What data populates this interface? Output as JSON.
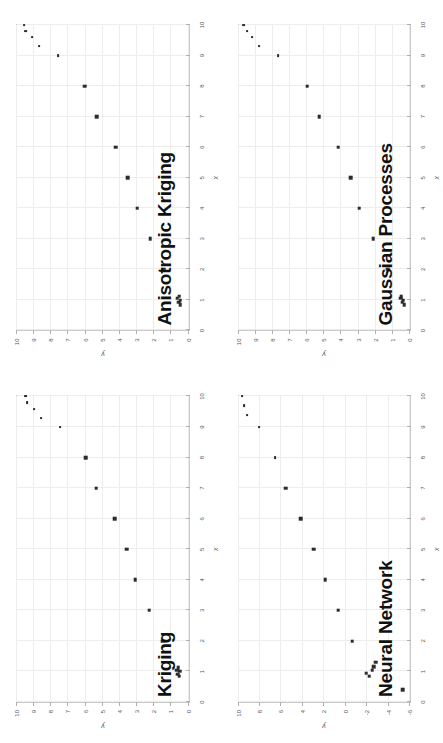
{
  "figure": {
    "layout": "2x2 grid of scatter panels",
    "rotation_degrees": -90,
    "background_color": "#ffffff",
    "marker_color": "#2b2b2b",
    "grid_color": "#ededed",
    "frame_color": "#c9c9c9"
  },
  "panels": [
    {
      "id": "kriging",
      "title": "Kriging",
      "position": "top-left"
    },
    {
      "id": "anisotropic-kriging",
      "title": "Anisotropic Kriging",
      "position": "top-right"
    },
    {
      "id": "neural-network",
      "title": "Neural Network",
      "position": "bottom-left"
    },
    {
      "id": "gaussian-processes",
      "title": "Gaussian Processes",
      "position": "bottom-right"
    }
  ],
  "chart_data": [
    {
      "type": "scatter",
      "title": "Kriging",
      "xlabel": "x",
      "ylabel": "y",
      "xlim": [
        0,
        10
      ],
      "ylim": [
        0,
        10
      ],
      "xticks": [
        0,
        1,
        2,
        3,
        4,
        5,
        6,
        7,
        8,
        9,
        10
      ],
      "yticks": [
        0,
        1,
        2,
        3,
        4,
        5,
        6,
        7,
        8,
        9,
        10
      ],
      "grid": true,
      "legend": "none",
      "x": [
        0.85,
        0.92,
        1.0,
        1.05,
        1.12,
        2.0,
        3.0,
        4.0,
        5.0,
        6.0,
        7.0,
        8.0,
        9.0,
        9.3,
        9.6,
        9.8,
        10.0
      ],
      "y": [
        0.55,
        0.62,
        0.52,
        0.7,
        0.6,
        1.5,
        2.3,
        3.1,
        3.6,
        4.3,
        5.4,
        6.0,
        7.5,
        8.6,
        9.0,
        9.4,
        9.5
      ]
    },
    {
      "type": "scatter",
      "title": "Anisotropic Kriging",
      "xlabel": "x",
      "ylabel": "y",
      "xlim": [
        0,
        10
      ],
      "ylim": [
        0,
        10
      ],
      "xticks": [
        0,
        1,
        2,
        3,
        4,
        5,
        6,
        7,
        8,
        9,
        10
      ],
      "yticks": [
        0,
        1,
        2,
        3,
        4,
        5,
        6,
        7,
        8,
        9,
        10
      ],
      "grid": true,
      "legend": "none",
      "x": [
        0.85,
        0.92,
        1.0,
        1.05,
        1.12,
        2.0,
        3.0,
        4.0,
        5.0,
        6.0,
        7.0,
        8.0,
        9.0,
        9.3,
        9.6,
        9.8,
        10.0
      ],
      "y": [
        0.5,
        0.58,
        0.48,
        0.66,
        0.56,
        1.45,
        2.25,
        3.0,
        3.55,
        4.25,
        5.35,
        6.05,
        7.6,
        8.7,
        9.1,
        9.5,
        9.6
      ]
    },
    {
      "type": "scatter",
      "title": "Neural Network",
      "xlabel": "x",
      "ylabel": "y",
      "xlim": [
        0,
        10
      ],
      "ylim": [
        -6,
        10
      ],
      "xticks": [
        0,
        1,
        2,
        3,
        4,
        5,
        6,
        7,
        8,
        9,
        10
      ],
      "yticks": [
        -6,
        -4,
        -2,
        0,
        2,
        4,
        6,
        8,
        10
      ],
      "grid": true,
      "legend": "none",
      "x": [
        0.4,
        0.85,
        0.95,
        1.05,
        1.15,
        1.3,
        2.0,
        3.0,
        4.0,
        5.0,
        6.0,
        7.0,
        8.0,
        9.0,
        9.4,
        9.7,
        10.0
      ],
      "y": [
        -5.3,
        -2.2,
        -1.9,
        -2.5,
        -2.6,
        -2.8,
        -0.6,
        0.7,
        1.9,
        3.0,
        4.2,
        5.6,
        6.6,
        8.1,
        9.2,
        9.5,
        9.7
      ]
    },
    {
      "type": "scatter",
      "title": "Gaussian Processes",
      "xlabel": "x",
      "ylabel": "y",
      "xlim": [
        0,
        10
      ],
      "ylim": [
        0,
        10
      ],
      "xticks": [
        0,
        1,
        2,
        3,
        4,
        5,
        6,
        7,
        8,
        9,
        10
      ],
      "yticks": [
        0,
        1,
        2,
        3,
        4,
        5,
        6,
        7,
        8,
        9,
        10
      ],
      "grid": true,
      "legend": "none",
      "x": [
        0.85,
        0.92,
        1.0,
        1.05,
        1.12,
        2.0,
        3.0,
        4.0,
        5.0,
        6.0,
        7.0,
        8.0,
        9.0,
        9.3,
        9.6,
        9.8,
        10.0
      ],
      "y": [
        0.35,
        0.45,
        0.4,
        0.55,
        0.5,
        1.3,
        2.15,
        2.95,
        3.45,
        4.2,
        5.3,
        6.0,
        7.7,
        8.8,
        9.2,
        9.5,
        9.7
      ]
    }
  ]
}
